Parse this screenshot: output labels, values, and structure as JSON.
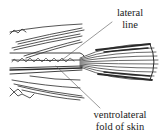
{
  "figure": {
    "stroke_color": "#2a2a2a",
    "background": "#ffffff"
  },
  "labels": {
    "lateral_line": {
      "line1": "lateral",
      "line2": "line"
    },
    "ventrolateral_fold": {
      "line1": "ventrolateral",
      "line2": "fold of skin"
    }
  }
}
